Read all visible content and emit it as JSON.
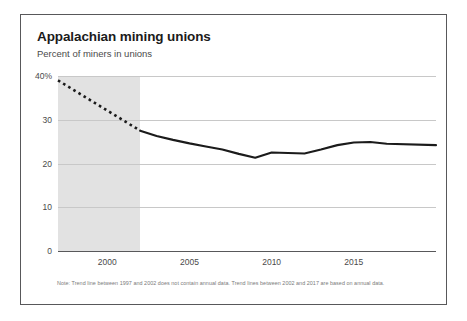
{
  "card": {
    "title": "Appalachian mining unions",
    "subtitle": "Percent of miners in unions",
    "note": "Note: Trend line between 1997 and 2002 does not contain annual data. Trend lines between 2002 and 2017 are based on annual data."
  },
  "colors": {
    "line": "#1b1b1b",
    "band": "#e2e2e2",
    "grid": "#c8c8c8",
    "axis": "#58585a",
    "border": "#58585a",
    "background": "#ffffff",
    "title_text": "#1b1b1b",
    "label_text": "#4a4a4a",
    "note_text": "#7a7a7a"
  },
  "chart_data": {
    "type": "line",
    "title": "Appalachian mining unions",
    "subtitle": "Percent of miners in unions",
    "xlabel": "",
    "ylabel": "Percent of miners in unions",
    "xlim": [
      1997,
      2020
    ],
    "ylim": [
      0,
      40
    ],
    "yticks": [
      0,
      10,
      20,
      30,
      40
    ],
    "ytick_labels": [
      "0",
      "10",
      "20",
      "30",
      "40%"
    ],
    "xticks": [
      2000,
      2005,
      2010,
      2015
    ],
    "xtick_labels": [
      "2000",
      "2005",
      "2010",
      "2015"
    ],
    "grid": "horizontal",
    "legend": "none",
    "shaded_region": {
      "label": "no annual data",
      "x_start": 1997,
      "x_end": 2002,
      "color": "#e2e2e2"
    },
    "series": [
      {
        "name": "Percent of miners in unions (interpolated)",
        "style": "dashed",
        "x": [
          1997,
          2002
        ],
        "values": [
          39.0,
          27.5
        ]
      },
      {
        "name": "Percent of miners in unions (annual)",
        "style": "solid",
        "x": [
          2002,
          2003,
          2004,
          2005,
          2006,
          2007,
          2008,
          2009,
          2010,
          2011,
          2012,
          2013,
          2014,
          2015,
          2016,
          2017,
          2020
        ],
        "values": [
          27.5,
          26.3,
          25.4,
          24.6,
          23.9,
          23.2,
          22.2,
          21.3,
          22.5,
          22.4,
          22.3,
          23.2,
          24.2,
          24.8,
          24.9,
          24.5,
          24.2
        ]
      }
    ],
    "note": "Note: Trend line between 1997 and 2002 does not contain annual data. Trend lines between 2002 and 2017 are based on annual data."
  }
}
